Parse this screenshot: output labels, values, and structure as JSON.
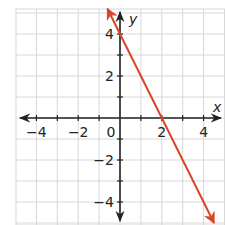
{
  "chart_data": {
    "type": "line",
    "title": "",
    "xlabel": "x",
    "ylabel": "y",
    "xlim": [
      -5,
      5
    ],
    "ylim": [
      -5,
      5
    ],
    "grid": true,
    "x_ticks": [
      -4,
      -2,
      0,
      2,
      4
    ],
    "y_ticks": [
      -4,
      -2,
      2,
      4
    ],
    "x_tick_labels": [
      "−4",
      "−2",
      "0",
      "2",
      "4"
    ],
    "y_tick_labels": [
      "−4",
      "−2",
      "2",
      "4"
    ],
    "series": [
      {
        "name": "line",
        "equation": "y = -2x + 4",
        "color": "#D9442B",
        "points": [
          [
            -0.6,
            5.2
          ],
          [
            0,
            4
          ],
          [
            2,
            0
          ],
          [
            4.5,
            -5
          ]
        ],
        "arrows": "both"
      }
    ],
    "colors": {
      "axis": "#222222",
      "grid": "#d8d8d8",
      "line": "#D9442B"
    }
  }
}
